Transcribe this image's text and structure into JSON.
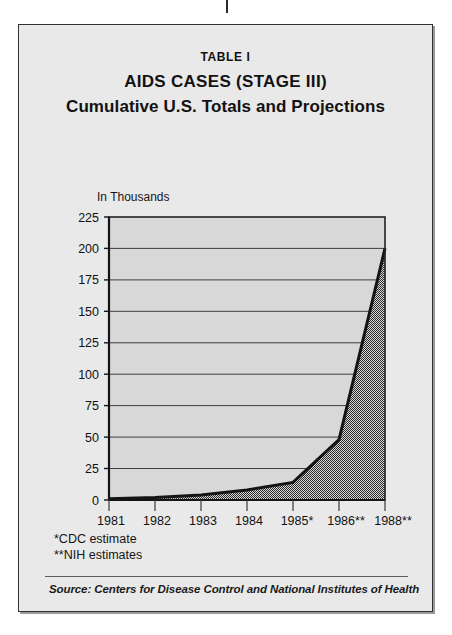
{
  "header": {
    "table_label": "TABLE I",
    "title_line1": "AIDS CASES (STAGE III)",
    "title_line2": "Cumulative U.S. Totals and Projections"
  },
  "footnotes": {
    "cdc": "*CDC estimate",
    "nih": "**NIH estimates"
  },
  "source": {
    "text": "Source: Centers for Disease Control and National Institutes of Health"
  },
  "colors": {
    "card_background": "#e9e9e9",
    "plot_background": "#d8d8d8",
    "area_fill": "#8a8a8a",
    "line": "#141414",
    "frame": "#323232",
    "gridline": "#3d3d3d",
    "text": "#121212"
  },
  "chart_data": {
    "type": "area",
    "title": "AIDS CASES (STAGE III) Cumulative U.S. Totals and Projections",
    "subtitle": "TABLE I",
    "xlabel": "",
    "ylabel": "In Thousands",
    "categories": [
      "1981",
      "1982",
      "1983",
      "1984",
      "1985*",
      "1986**",
      "1988**"
    ],
    "x": [
      1981,
      1982,
      1983,
      1984,
      1985,
      1986,
      1988
    ],
    "values": [
      1,
      2,
      4,
      8,
      14,
      48,
      200
    ],
    "ylim": [
      0,
      225
    ],
    "yticks": [
      0,
      25,
      50,
      75,
      100,
      125,
      150,
      175,
      200,
      225
    ],
    "ytick_labels": [
      "0",
      "25",
      "50",
      "75",
      "100",
      "125",
      "150",
      "175",
      "200",
      "225"
    ],
    "grid": true,
    "grid_axis": "y",
    "legend": "none",
    "series": [
      {
        "name": "Cumulative AIDS cases (thousands)",
        "values": [
          1,
          2,
          4,
          8,
          14,
          48,
          200
        ]
      }
    ],
    "annotations": [
      "*CDC estimate",
      "**NIH estimates"
    ]
  }
}
